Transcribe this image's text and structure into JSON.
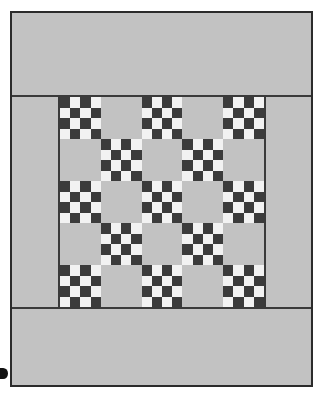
{
  "image": {
    "subject": "patchwork quilt",
    "pattern_name": "single irish chain / nine-patch checkerboard quilt",
    "caption": ""
  },
  "colors": {
    "background_fabric": "#c2c2c2",
    "dark_patch": "#3b3b3b",
    "light_patch": "#f2f2f2",
    "frame_line": "#2b2b2b",
    "sashing_line": "#3a3a3a",
    "page_background": "#ffffff"
  },
  "quilt": {
    "frame": {
      "border_width_px": 2,
      "border_color": "#2b2b2b"
    },
    "borders": {
      "top_band_label": "plain top border band",
      "bottom_band_label": "plain bottom border band",
      "left_column_label": "plain left border column",
      "right_column_label": "plain right border column"
    },
    "grid": {
      "rows": 5,
      "columns": 5,
      "checker_subdivisions": 4,
      "layout": [
        [
          "checker",
          "plain",
          "checker",
          "plain",
          "checker"
        ],
        [
          "plain",
          "checker",
          "plain",
          "checker",
          "plain"
        ],
        [
          "checker",
          "plain",
          "checker",
          "plain",
          "checker"
        ],
        [
          "plain",
          "checker",
          "plain",
          "checker",
          "plain"
        ],
        [
          "checker",
          "plain",
          "checker",
          "plain",
          "checker"
        ]
      ]
    }
  },
  "markers": {
    "corner_dot_label": "black edge marker"
  }
}
